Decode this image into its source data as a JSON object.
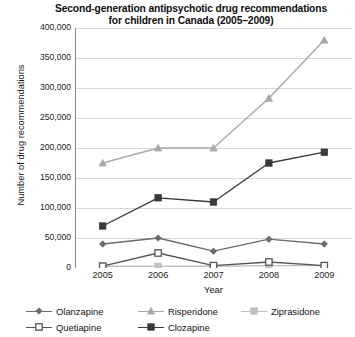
{
  "chart_data": {
    "type": "line",
    "title": "Second-generation antipsychotic drug recommendations for children in Canada (2005–2009)",
    "title_line1": "Second-generation antipsychotic drug recommendations",
    "title_line2": "for children in Canada (2005–2009)",
    "xlabel": "Year",
    "ylabel": "Number of drug recommendations",
    "categories": [
      "2005",
      "2006",
      "2007",
      "2008",
      "2009"
    ],
    "x": [
      2005,
      2006,
      2007,
      2008,
      2009
    ],
    "ylim": [
      0,
      400000
    ],
    "ytick_values": [
      0,
      50000,
      100000,
      150000,
      200000,
      250000,
      300000,
      350000,
      400000
    ],
    "ytick_labels": [
      "0",
      "50,000",
      "100,000",
      "150,000",
      "200,000",
      "250,000",
      "300,000",
      "350,000",
      "400,000"
    ],
    "grid": true,
    "legend_position": "bottom",
    "series": [
      {
        "name": "Olanzapine",
        "values": [
          40000,
          50000,
          28000,
          48000,
          40000
        ],
        "color": "#6b6b6b",
        "marker": "diamond"
      },
      {
        "name": "Risperidone",
        "values": [
          175000,
          200000,
          200000,
          283000,
          380000
        ],
        "color": "#a8a8a8",
        "marker": "triangle"
      },
      {
        "name": "Ziprasidone",
        "values": [
          3000,
          3000,
          3000,
          4000,
          4000
        ],
        "color": "#c0c0c0",
        "marker": "square-light"
      },
      {
        "name": "Quetiapine",
        "values": [
          3000,
          25000,
          4000,
          10000,
          4000
        ],
        "color": "#555555",
        "marker": "square-open"
      },
      {
        "name": "Clozapine",
        "values": [
          70000,
          117000,
          110000,
          175000,
          193000
        ],
        "color": "#3a3a3a",
        "marker": "square-filled"
      }
    ]
  },
  "legend": {
    "rows": [
      [
        "Olanzapine",
        "Risperidone",
        "Ziprasidone"
      ],
      [
        "Quetiapine",
        "Clozapine"
      ]
    ]
  },
  "colors": {
    "axis": "#8a8a8a",
    "grid": "#d9d9d9",
    "text": "#1a1a1a",
    "background": "#ffffff"
  }
}
